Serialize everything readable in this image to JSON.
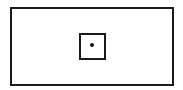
{
  "diagram": {
    "shapes": [
      {
        "type": "rectangle",
        "role": "outer-boundary"
      },
      {
        "type": "square",
        "role": "inner-box"
      },
      {
        "type": "dot",
        "role": "center-point"
      }
    ],
    "colors": {
      "stroke": "#1a1a1a",
      "background": "#ffffff"
    }
  }
}
